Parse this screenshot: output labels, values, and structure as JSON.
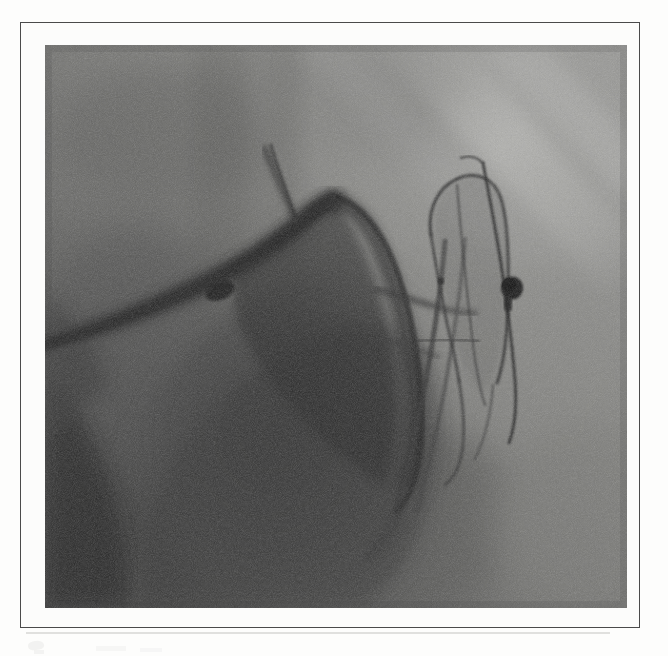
{
  "figure": {
    "modality": "fluoroscopy-angiography",
    "caption": "",
    "alt_text": "Coronary angiogram fluoroscopic still showing a balloon catheter and guidewire positioned in a coronary artery with a radiopaque marker",
    "frame": {
      "border_color": "#4a4a4a",
      "mount_color": "#fcfcfb",
      "page_color": "#fdfdfc"
    },
    "image": {
      "base_gray": "#6f6f6f",
      "highlight_gray": "#9d9d9a",
      "shadow_gray": "#3a3a3a",
      "deep_shadow_gray": "#262626",
      "marker_color": "#1b1b1b",
      "width_px": 582,
      "height_px": 563
    }
  },
  "anatomy": {
    "regions": [
      {
        "name": "cardiac-silhouette",
        "label": "Cardiac silhouette",
        "tone": "dark"
      },
      {
        "name": "lung-field-upper-right",
        "label": "Upper right lung field",
        "tone": "light"
      },
      {
        "name": "rib-shadow-diagonal",
        "label": "Diagonal rib shadow",
        "tone": "light"
      },
      {
        "name": "diaphragm-lower-left",
        "label": "Lower left diaphragmatic border",
        "tone": "dark"
      },
      {
        "name": "spine-shadow",
        "label": "Vertebral column shadow",
        "tone": "mid"
      }
    ]
  },
  "devices": {
    "items": [
      {
        "name": "guidewire",
        "label": "Guidewire",
        "color": "#202020"
      },
      {
        "name": "balloon-catheter",
        "label": "Balloon / stent catheter",
        "color": "#2d2d2d"
      },
      {
        "name": "radiopaque-marker",
        "label": "Radiopaque marker",
        "color": "#151515"
      },
      {
        "name": "guiding-catheter",
        "label": "Guiding catheter",
        "color": "#2a2a2a"
      }
    ]
  },
  "vessels": {
    "items": [
      {
        "name": "contrast-filled-coronary",
        "label": "Contrast-filled coronary artery"
      },
      {
        "name": "side-branch",
        "label": "Coronary side branch"
      }
    ]
  },
  "artifacts": {
    "items": [
      {
        "name": "scan-smudge-left",
        "label": "Scan smudge"
      },
      {
        "name": "scan-streak-baseline",
        "label": "Baseline scan streak"
      }
    ]
  }
}
